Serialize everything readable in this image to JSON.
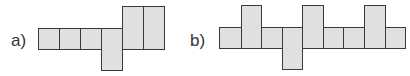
{
  "figures": [
    {
      "label": "a)",
      "label_pos": [
        11,
        32
      ],
      "squares": [
        {
          "x": 38,
          "y": 28,
          "w": 22,
          "h": 22
        },
        {
          "x": 59,
          "y": 28,
          "w": 22,
          "h": 22
        },
        {
          "x": 80,
          "y": 28,
          "w": 22,
          "h": 22
        },
        {
          "x": 101,
          "y": 28,
          "w": 22,
          "h": 43
        },
        {
          "x": 122,
          "y": 6,
          "w": 22,
          "h": 44
        },
        {
          "x": 143,
          "y": 6,
          "w": 22,
          "h": 44
        }
      ]
    },
    {
      "label": "b)",
      "label_pos": [
        190,
        32
      ],
      "squares": [
        {
          "x": 219,
          "y": 27,
          "w": 23,
          "h": 22
        },
        {
          "x": 241,
          "y": 5,
          "w": 21,
          "h": 44
        },
        {
          "x": 261,
          "y": 27,
          "w": 22,
          "h": 22
        },
        {
          "x": 282,
          "y": 27,
          "w": 21,
          "h": 43
        },
        {
          "x": 302,
          "y": 5,
          "w": 22,
          "h": 44
        },
        {
          "x": 323,
          "y": 27,
          "w": 21,
          "h": 22
        },
        {
          "x": 343,
          "y": 27,
          "w": 22,
          "h": 22
        },
        {
          "x": 364,
          "y": 5,
          "w": 22,
          "h": 44
        },
        {
          "x": 385,
          "y": 27,
          "w": 21,
          "h": 22
        }
      ]
    }
  ],
  "colors": {
    "fill": "#e0e0e0",
    "stroke": "#3a3a3a",
    "label": "#333333"
  }
}
